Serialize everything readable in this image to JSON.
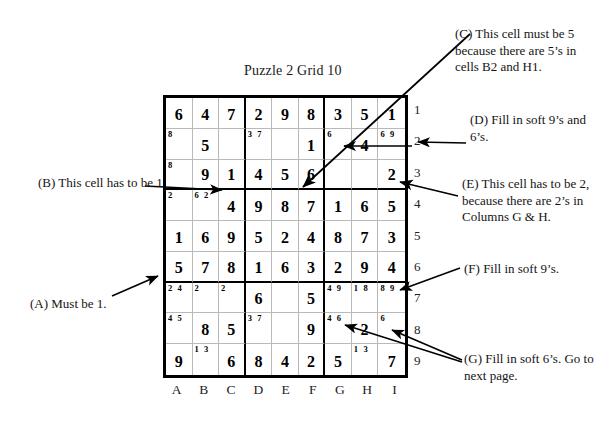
{
  "title": "Puzzle 2  Grid 10",
  "grid": {
    "column_labels": [
      "A",
      "B",
      "C",
      "D",
      "E",
      "F",
      "G",
      "H",
      "I"
    ],
    "row_labels": [
      "1",
      "2",
      "3",
      "4",
      "5",
      "6",
      "7",
      "8",
      "9"
    ],
    "cells": [
      [
        {
          "v": "6"
        },
        {
          "v": "4"
        },
        {
          "v": "7"
        },
        {
          "v": "2"
        },
        {
          "v": "9"
        },
        {
          "v": "8"
        },
        {
          "v": "3"
        },
        {
          "v": "5"
        },
        {
          "v": "1"
        }
      ],
      [
        {
          "v": "",
          "p": "8"
        },
        {
          "v": "5"
        },
        {
          "v": ""
        },
        {
          "v": "",
          "p": "3 7"
        },
        {
          "v": ""
        },
        {
          "v": "1"
        },
        {
          "v": "",
          "p": "6"
        },
        {
          "v": "4"
        },
        {
          "v": "",
          "p": "6 9"
        }
      ],
      [
        {
          "v": "",
          "p": "8"
        },
        {
          "v": "9"
        },
        {
          "v": "1"
        },
        {
          "v": "4"
        },
        {
          "v": "5"
        },
        {
          "v": "6"
        },
        {
          "v": ""
        },
        {
          "v": ""
        },
        {
          "v": "2"
        }
      ],
      [
        {
          "v": "",
          "p": "2"
        },
        {
          "v": "",
          "p": "6 2"
        },
        {
          "v": "4"
        },
        {
          "v": "9"
        },
        {
          "v": "8"
        },
        {
          "v": "7"
        },
        {
          "v": "1"
        },
        {
          "v": "6"
        },
        {
          "v": "5"
        }
      ],
      [
        {
          "v": "1"
        },
        {
          "v": "6"
        },
        {
          "v": "9"
        },
        {
          "v": "5"
        },
        {
          "v": "2"
        },
        {
          "v": "4"
        },
        {
          "v": "8"
        },
        {
          "v": "7"
        },
        {
          "v": "3"
        }
      ],
      [
        {
          "v": "5"
        },
        {
          "v": "7"
        },
        {
          "v": "8"
        },
        {
          "v": "1"
        },
        {
          "v": "6"
        },
        {
          "v": "3"
        },
        {
          "v": "2"
        },
        {
          "v": "9"
        },
        {
          "v": "4"
        }
      ],
      [
        {
          "v": "",
          "p": "2 4"
        },
        {
          "v": "",
          "p": "2"
        },
        {
          "v": "",
          "p": "2"
        },
        {
          "v": "6"
        },
        {
          "v": ""
        },
        {
          "v": "5"
        },
        {
          "v": "",
          "p": "4 9"
        },
        {
          "v": "",
          "p": "1 8"
        },
        {
          "v": "",
          "p": "8 9"
        }
      ],
      [
        {
          "v": "",
          "p": "4 5"
        },
        {
          "v": "8"
        },
        {
          "v": "5"
        },
        {
          "v": "",
          "p": "3 7"
        },
        {
          "v": ""
        },
        {
          "v": "9"
        },
        {
          "v": "",
          "p": "4 6"
        },
        {
          "v": "2"
        },
        {
          "v": "",
          "p": "6"
        }
      ],
      [
        {
          "v": "9"
        },
        {
          "v": "",
          "p": "1 3"
        },
        {
          "v": "6"
        },
        {
          "v": "8"
        },
        {
          "v": "4"
        },
        {
          "v": "2"
        },
        {
          "v": "5"
        },
        {
          "v": "",
          "p": "1 3"
        },
        {
          "v": "7"
        }
      ]
    ]
  },
  "annotations": {
    "a": "(A) Must be 1.",
    "b": "(B) This cell has to be 1.",
    "c": "(C) This cell must be 5 because there are 5’s in cells B2 and H1.",
    "d": "(D) Fill in soft 9’s and 6’s.",
    "e": "(E) This cell has to be 2, because there are 2’s in Columns G & H.",
    "f": "(F) Fill in soft 9’s.",
    "g": "(G) Fill in soft 6’s. Go to next page."
  },
  "colors": {
    "ink": "#000000",
    "grid_light": "#b9b9b9",
    "background": "#ffffff"
  }
}
